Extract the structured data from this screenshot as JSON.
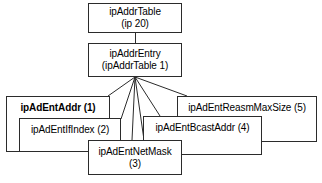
{
  "diagram": {
    "background_color": "#ffffff",
    "line_color": "#2b2b2b",
    "text_color": "#000000",
    "nodes": {
      "root": {
        "line1": "ipAddrTable",
        "line2": "(ip 20)"
      },
      "entry": {
        "line1": "ipAddrEntry",
        "line2": "(ipAddrTable 1)"
      },
      "addr": {
        "line1": "ipAdEntAddr (1)",
        "line2": ""
      },
      "ifindex": {
        "line1": "ipAdEntIfIndex (2)",
        "line2": ""
      },
      "netmask": {
        "line1": "ipAdEntNetMask",
        "line2": "(3)"
      },
      "bcast": {
        "line1": "ipAdEntBcastAddr (4)",
        "line2": ""
      },
      "reasm": {
        "line1": "ipAdEntReasmMaxSize (5)",
        "line2": ""
      }
    }
  }
}
